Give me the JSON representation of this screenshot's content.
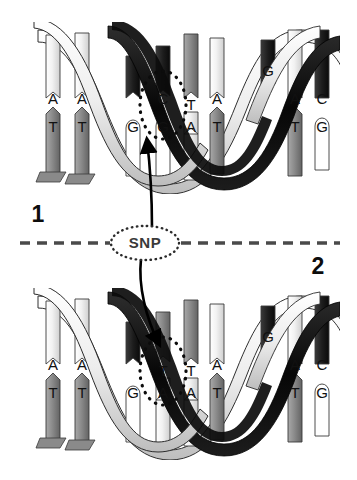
{
  "figure": {
    "background_color": "#ffffff",
    "width": 357,
    "height": 480
  },
  "divider": {
    "type": "dashed-horizontal-line",
    "color": "#4a4a4a",
    "y": 243,
    "x_start": 20,
    "x_end": 340,
    "dash": "10 7"
  },
  "callout": {
    "label": "SNP",
    "shape": "ellipse",
    "border_style": "dotted",
    "border_color": "#2b2b2b",
    "text_color": "#3a3a3a",
    "cx": 145,
    "cy": 243,
    "rx": 34,
    "ry": 17
  },
  "panels": [
    {
      "id": "panel-1",
      "number": "1",
      "number_x": 38,
      "number_y": 216,
      "helix_top": 24,
      "helix_bottom": 190,
      "variant_top_base": "C",
      "variant_bottom_base": "G",
      "highlight": {
        "shape": "ellipse",
        "border_style": "dotted",
        "border_color": "#111111",
        "cx": 163,
        "cy": 105,
        "rx": 23,
        "ry": 34
      },
      "pairs": [
        {
          "top": "A",
          "bottom": "T",
          "x": 53,
          "circled": false
        },
        {
          "top": "A",
          "bottom": "T",
          "x": 82,
          "circled": false
        },
        {
          "top": "",
          "bottom": "G",
          "x": 133,
          "circled": false
        },
        {
          "top": "C",
          "bottom": "G",
          "x": 163,
          "circled": true
        },
        {
          "top": "T",
          "bottom": "A",
          "x": 191,
          "circled": false
        },
        {
          "top": "A",
          "bottom": "T",
          "x": 217,
          "circled": false
        },
        {
          "top": "G",
          "bottom": "",
          "x": 268,
          "circled": false
        },
        {
          "top": "A",
          "bottom": "T",
          "x": 295,
          "circled": false
        },
        {
          "top": "C",
          "bottom": "G",
          "x": 322,
          "circled": false
        }
      ]
    },
    {
      "id": "panel-2",
      "number": "2",
      "number_x": 318,
      "number_y": 268,
      "helix_top": 290,
      "helix_bottom": 456,
      "variant_top_base": "T",
      "variant_bottom_base": "A",
      "highlight": {
        "shape": "ellipse",
        "border_style": "dotted",
        "border_color": "#111111",
        "cx": 163,
        "cy": 371,
        "rx": 23,
        "ry": 34
      },
      "pairs": [
        {
          "top": "A",
          "bottom": "T",
          "x": 53,
          "circled": false
        },
        {
          "top": "A",
          "bottom": "T",
          "x": 82,
          "circled": false
        },
        {
          "top": "",
          "bottom": "G",
          "x": 133,
          "circled": false
        },
        {
          "top": "T",
          "bottom": "A",
          "x": 163,
          "circled": true
        },
        {
          "top": "T",
          "bottom": "A",
          "x": 191,
          "circled": false
        },
        {
          "top": "A",
          "bottom": "T",
          "x": 217,
          "circled": false
        },
        {
          "top": "G",
          "bottom": "",
          "x": 268,
          "circled": false
        },
        {
          "top": "A",
          "bottom": "T",
          "x": 295,
          "circled": false
        },
        {
          "top": "C",
          "bottom": "G",
          "x": 322,
          "circled": false
        }
      ]
    }
  ],
  "arrows": [
    {
      "name": "arrow-to-panel-1",
      "from_x": 150,
      "from_y": 226,
      "to_x": 148,
      "to_y": 133,
      "color": "#000000"
    },
    {
      "name": "arrow-to-panel-2",
      "from_x": 141,
      "from_y": 261,
      "to_x": 160,
      "to_y": 345,
      "color": "#000000"
    }
  ],
  "palette": {
    "ink": "#000000",
    "ribbon_dark": "#111111",
    "ribbon_light": "#e9e9e9",
    "rung_light": "#efefef",
    "rung_mid": "#8e8e8e",
    "rung_dark": "#2c2c2c",
    "outline": "#2a2a2a"
  }
}
